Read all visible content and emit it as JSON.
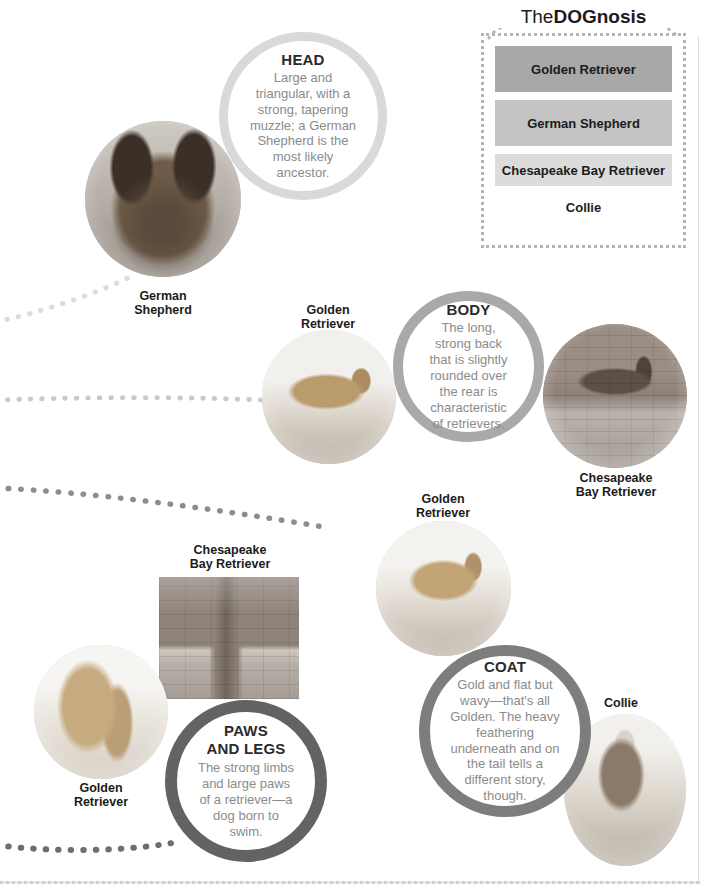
{
  "legend": {
    "title_plain_1": "The",
    "title_strong": "DOG",
    "title_plain_2": "nosis",
    "bars": [
      {
        "label": "Golden Retriever",
        "color": "#a8a8a8"
      },
      {
        "label": "German Shepherd",
        "color": "#c4c4c4"
      },
      {
        "label": "Chesapeake Bay Retriever",
        "color": "#dcdcdc"
      },
      {
        "label": "Collie",
        "color": "#ffffff"
      }
    ]
  },
  "callouts": {
    "head": {
      "title": "HEAD",
      "body": "Large and triangular, with a strong, tapering muzzle; a German Shepherd is the most likely ancestor.",
      "ring_color": "#d9d9d9"
    },
    "body": {
      "title": "BODY",
      "body": "The long, strong back that is slightly rounded over the rear is characteristic of retrievers.",
      "ring_color": "#a9a9a9"
    },
    "coat": {
      "title": "COAT",
      "body": "Gold and flat but wavy—that's all Golden. The heavy feathering underneath and on the tail tells a different story, though.",
      "ring_color": "#7d7d7d"
    },
    "paws": {
      "title_line_1": "PAWS",
      "title_line_2": "AND LEGS",
      "body": "The strong limbs and large paws of a retriever—a dog born to swim.",
      "ring_color": "#636363"
    }
  },
  "captions": {
    "german_shepherd": "German\nShepherd",
    "golden_retriever_body": "Golden\nRetriever",
    "chesapeake_body": "Chesapeake\nBay Retriever",
    "chesapeake_paws": "Chesapeake\nBay Retriever",
    "golden_retriever_coat": "Golden\nRetriever",
    "golden_retriever_paws": "Golden\nRetriever",
    "collie": "Collie"
  },
  "photos": {
    "german_shepherd_head": "german-shepherd-head-photo",
    "golden_retriever_standing": "golden-retriever-standing-photo",
    "chesapeake_on_steps": "chesapeake-bay-retriever-on-steps-photo",
    "chesapeake_legs": "chesapeake-bay-retriever-legs-photo",
    "golden_retriever_coat": "golden-retriever-coat-photo",
    "golden_retriever_legs": "golden-retriever-legs-photo",
    "collie_standing": "collie-standing-photo"
  },
  "trail_color_top": "#dcdcdc",
  "trail_color_mid": "#c9c9c9",
  "trail_color_low": "#8d8d8d",
  "trail_color_bottom": "#6e6e6e"
}
